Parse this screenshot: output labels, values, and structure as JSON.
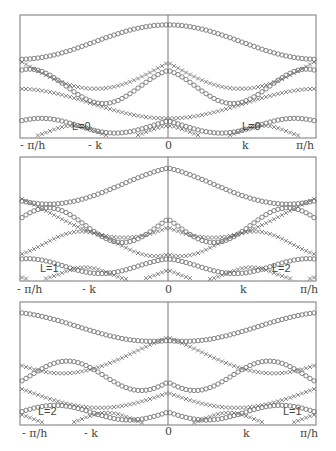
{
  "figure": {
    "panels": [
      {
        "id": "top",
        "annotation_left": "L=0",
        "annotation_right": "L=0"
      },
      {
        "id": "middle",
        "annotation_left": "L=1",
        "annotation_right": "L=2"
      },
      {
        "id": "bottom",
        "annotation_left": "L=2",
        "annotation_right": "L=1"
      }
    ],
    "x_ticks": [
      "- π/h",
      "- k",
      "0",
      "k",
      "π/h"
    ]
  },
  "chart_data": {
    "type": "scatter",
    "title": "",
    "xlabel": "",
    "ylabel": "",
    "x_tick_labels": [
      "-π/h",
      "-k",
      "0",
      "k",
      "π/h"
    ],
    "xlim": [
      "-π/h",
      "π/h"
    ],
    "grid": false,
    "legend": "none; markers: circles (o) and crosses (+/x) denote two branch families",
    "panels": [
      {
        "panel": 1,
        "left_label": "L=0",
        "right_label": "L=0",
        "description": "Dispersion-like band curves plotted symmetric about k=0; approximate sinusoidal branches of circles and crosses"
      },
      {
        "panel": 2,
        "left_label": "L=1",
        "right_label": "L=2",
        "description": "Band curves, left half L=1 and right half L=2, with crossings near ±k"
      },
      {
        "panel": 3,
        "left_label": "L=2",
        "right_label": "L=1",
        "description": "Band curves, left half L=2 and right half L=1 (mirror of panel 2)"
      }
    ],
    "note": "No y-axis values are shown; curves are qualitative"
  }
}
